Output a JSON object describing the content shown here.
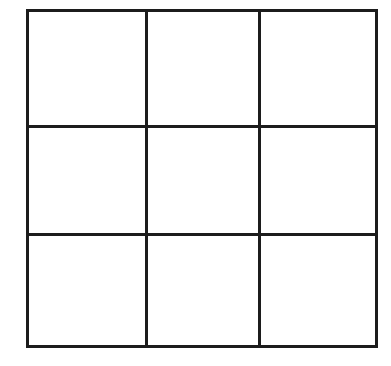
{
  "diagram": {
    "type": "tic-tac-toe-grid",
    "rows": 3,
    "cols": 3,
    "line_color": "#1c1c1c",
    "background_color": "#ffffff",
    "cells": [
      [
        "",
        "",
        ""
      ],
      [
        "",
        "",
        ""
      ],
      [
        "",
        "",
        ""
      ]
    ]
  }
}
